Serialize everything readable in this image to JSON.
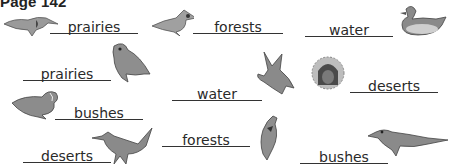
{
  "header": {
    "title": "Page 142"
  },
  "answers": [
    {
      "label": "prairies",
      "bird": "meadowlark"
    },
    {
      "label": "forests",
      "bird": "cardinal"
    },
    {
      "label": "water",
      "bird": "mallard-duck"
    },
    {
      "label": "prairies",
      "bird": "sparrow"
    },
    {
      "label": "water",
      "bird": "flying-duck"
    },
    {
      "label": "deserts",
      "bird": "owl-in-cactus-hole"
    },
    {
      "label": "bushes",
      "bird": "quail"
    },
    {
      "label": "deserts",
      "bird": "roadrunner"
    },
    {
      "label": "forests",
      "bird": "woodpecker"
    },
    {
      "label": "bushes",
      "bird": "thrasher"
    }
  ],
  "colors": {
    "ink": "#2a2a2a",
    "line": "#333333",
    "bird_shade": "#8a8a8a"
  }
}
